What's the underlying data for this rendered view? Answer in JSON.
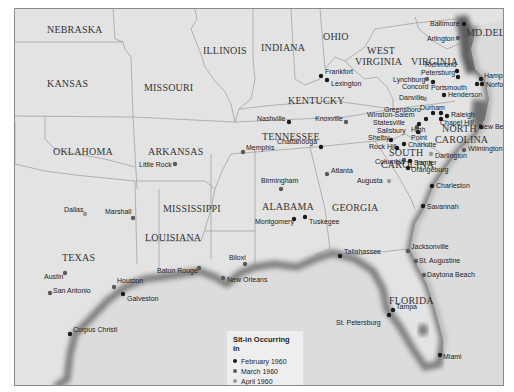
{
  "legend": {
    "title": "Sit-in Occurring in",
    "items": [
      {
        "label": "February 1960",
        "color": "#1a1a1a"
      },
      {
        "label": "March 1960",
        "color": "#5a5a5a"
      },
      {
        "label": "April 1960",
        "color": "#9a9a9a"
      }
    ]
  },
  "states": [
    {
      "name": "NEBRASKA",
      "x": 32,
      "y": 24
    },
    {
      "name": "KANSAS",
      "x": 32,
      "y": 78
    },
    {
      "name": "MISSOURI",
      "x": 129,
      "y": 82
    },
    {
      "name": "ILLINOIS",
      "x": 188,
      "y": 45
    },
    {
      "name": "INDIANA",
      "x": 246,
      "y": 42
    },
    {
      "name": "OHIO",
      "x": 308,
      "y": 31
    },
    {
      "name": "WEST",
      "x": 352,
      "y": 45
    },
    {
      "name": "VIRGINIA",
      "x": 340,
      "y": 56
    },
    {
      "name": "VIRGINIA",
      "x": 396,
      "y": 56
    },
    {
      "name": "MD.",
      "x": 451,
      "y": 27
    },
    {
      "name": "DEL.",
      "x": 470,
      "y": 27
    },
    {
      "name": "KENTUCKY",
      "x": 273,
      "y": 95
    },
    {
      "name": "TENNESSEE",
      "x": 247,
      "y": 131
    },
    {
      "name": "NORTH",
      "x": 427,
      "y": 123
    },
    {
      "name": "CAROLINA",
      "x": 420,
      "y": 134
    },
    {
      "name": "SOUTH",
      "x": 374,
      "y": 147
    },
    {
      "name": "CAROLINA",
      "x": 366,
      "y": 159
    },
    {
      "name": "OKLAHOMA",
      "x": 38,
      "y": 146
    },
    {
      "name": "ARKANSAS",
      "x": 133,
      "y": 146
    },
    {
      "name": "MISSISSIPPI",
      "x": 148,
      "y": 203
    },
    {
      "name": "ALABAMA",
      "x": 247,
      "y": 201
    },
    {
      "name": "GEORGIA",
      "x": 317,
      "y": 202
    },
    {
      "name": "LOUISIANA",
      "x": 130,
      "y": 232
    },
    {
      "name": "TEXAS",
      "x": 47,
      "y": 252
    },
    {
      "name": "FLORIDA",
      "x": 374,
      "y": 295
    }
  ],
  "cities": [
    {
      "name": "Baltimore",
      "x": 449,
      "y": 15,
      "month": "February 1960",
      "lx": 415,
      "ly": 17
    },
    {
      "name": "Arlington",
      "x": 443,
      "y": 29,
      "month": "March 1960",
      "lx": 412,
      "ly": 32
    },
    {
      "name": "Richmond",
      "x": 442,
      "y": 62,
      "month": "February 1960",
      "lx": 410,
      "ly": 58
    },
    {
      "name": "Petersburg",
      "x": 443,
      "y": 68,
      "month": "February 1960",
      "lx": 406,
      "ly": 66
    },
    {
      "name": "Hampton",
      "x": 466,
      "y": 70,
      "month": "February 1960",
      "lx": 469,
      "ly": 69
    },
    {
      "name": "Norfolk",
      "x": 467,
      "y": 75,
      "month": "February 1960",
      "lx": 471,
      "ly": 78
    },
    {
      "name": "Portsmouth",
      "x": 462,
      "y": 75,
      "month": "February 1960",
      "lx": 416,
      "ly": 81
    },
    {
      "name": "Lynchburg",
      "x": 412,
      "y": 70,
      "month": "March 1960",
      "lx": 378,
      "ly": 73
    },
    {
      "name": "Concord",
      "x": 418,
      "y": 73,
      "month": "February 1960",
      "lx": 387,
      "ly": 80
    },
    {
      "name": "Frankfort",
      "x": 306,
      "y": 67,
      "month": "February 1960",
      "lx": 310,
      "ly": 65
    },
    {
      "name": "Lexington",
      "x": 312,
      "y": 71,
      "month": "February 1960",
      "lx": 316,
      "ly": 77
    },
    {
      "name": "Danville",
      "x": 410,
      "y": 90,
      "month": "April 1960",
      "lx": 384,
      "ly": 91
    },
    {
      "name": "Henderson",
      "x": 429,
      "y": 86,
      "month": "February 1960",
      "lx": 433,
      "ly": 88
    },
    {
      "name": "Greensboro",
      "x": 418,
      "y": 104,
      "month": "February 1960",
      "lx": 369,
      "ly": 103
    },
    {
      "name": "Durham",
      "x": 426,
      "y": 104,
      "month": "February 1960",
      "lx": 405,
      "ly": 101
    },
    {
      "name": "Winston-Salem",
      "x": 411,
      "y": 110,
      "month": "February 1960",
      "lx": 352,
      "ly": 108
    },
    {
      "name": "Raleigh",
      "x": 432,
      "y": 107,
      "month": "February 1960",
      "lx": 436,
      "ly": 108
    },
    {
      "name": "Chapel Hill",
      "x": 426,
      "y": 110,
      "month": "February 1960",
      "lx": 425,
      "ly": 116
    },
    {
      "name": "Statesville",
      "x": 402,
      "y": 118,
      "month": "March 1960",
      "lx": 358,
      "ly": 116
    },
    {
      "name": "Salisbury",
      "x": 403,
      "y": 123,
      "month": "February 1960",
      "lx": 362,
      "ly": 124
    },
    {
      "name": "High",
      "x": 404,
      "y": 115,
      "month": "February 1960",
      "lx": 396,
      "ly": 123
    },
    {
      "name": "Point",
      "x": 0,
      "y": 0,
      "month": "",
      "lx": 396,
      "ly": 131
    },
    {
      "name": "Shelby",
      "x": 376,
      "y": 131,
      "month": "February 1960",
      "lx": 353,
      "ly": 131
    },
    {
      "name": "Rock Hill",
      "x": 382,
      "y": 139,
      "month": "February 1960",
      "lx": 354,
      "ly": 140
    },
    {
      "name": "Charlotte",
      "x": 389,
      "y": 135,
      "month": "February 1960",
      "lx": 393,
      "ly": 138
    },
    {
      "name": "New Bern",
      "x": 466,
      "y": 118,
      "month": "February 1960",
      "lx": 464,
      "ly": 120
    },
    {
      "name": "Wilmington",
      "x": 449,
      "y": 141,
      "month": "March 1960",
      "lx": 453,
      "ly": 142
    },
    {
      "name": "Darlington",
      "x": 416,
      "y": 145,
      "month": "April 1960",
      "lx": 420,
      "ly": 149
    },
    {
      "name": "Columbia",
      "x": 389,
      "y": 151,
      "month": "March 1960",
      "lx": 360,
      "ly": 155
    },
    {
      "name": "Sumter",
      "x": 395,
      "y": 152,
      "month": "February 1960",
      "lx": 399,
      "ly": 156
    },
    {
      "name": "Orangeburg",
      "x": 393,
      "y": 159,
      "month": "February 1960",
      "lx": 396,
      "ly": 163
    },
    {
      "name": "Augusta",
      "x": 374,
      "y": 172,
      "month": "April 1960",
      "lx": 342,
      "ly": 174
    },
    {
      "name": "Atlanta",
      "x": 312,
      "y": 165,
      "month": "March 1960",
      "lx": 316,
      "ly": 164
    },
    {
      "name": "Charleston",
      "x": 417,
      "y": 177,
      "month": "February 1960",
      "lx": 421,
      "ly": 179
    },
    {
      "name": "Savannah",
      "x": 408,
      "y": 197,
      "month": "February 1960",
      "lx": 412,
      "ly": 200
    },
    {
      "name": "Nashville",
      "x": 274,
      "y": 113,
      "month": "February 1960",
      "lx": 242,
      "ly": 112
    },
    {
      "name": "Knoxville",
      "x": 331,
      "y": 113,
      "month": "March 1960",
      "lx": 300,
      "ly": 112
    },
    {
      "name": "Chattanooga",
      "x": 306,
      "y": 138,
      "month": "February 1960",
      "lx": 262,
      "ly": 135
    },
    {
      "name": "Memphis",
      "x": 228,
      "y": 143,
      "month": "March 1960",
      "lx": 231,
      "ly": 141
    },
    {
      "name": "Little Rock",
      "x": 160,
      "y": 155,
      "month": "March 1960",
      "lx": 124,
      "ly": 158
    },
    {
      "name": "Birmingham",
      "x": 266,
      "y": 180,
      "month": "March 1960",
      "lx": 246,
      "ly": 174
    },
    {
      "name": "Montgomery",
      "x": 279,
      "y": 210,
      "month": "February 1960",
      "lx": 240,
      "ly": 215
    },
    {
      "name": "Tuskegee",
      "x": 290,
      "y": 208,
      "month": "February 1960",
      "lx": 294,
      "ly": 215
    },
    {
      "name": "Dallas",
      "x": 70,
      "y": 205,
      "month": "April 1960",
      "lx": 49,
      "ly": 203
    },
    {
      "name": "Marshall",
      "x": 118,
      "y": 209,
      "month": "March 1960",
      "lx": 90,
      "ly": 205
    },
    {
      "name": "Austin",
      "x": 50,
      "y": 264,
      "month": "March 1960",
      "lx": 29,
      "ly": 270
    },
    {
      "name": "San Antonio",
      "x": 35,
      "y": 284,
      "month": "March 1960",
      "lx": 38,
      "ly": 284
    },
    {
      "name": "Houston",
      "x": 99,
      "y": 278,
      "month": "March 1960",
      "lx": 102,
      "ly": 274
    },
    {
      "name": "Galveston",
      "x": 108,
      "y": 285,
      "month": "February 1960",
      "lx": 112,
      "ly": 292
    },
    {
      "name": "Corpus Christi",
      "x": 55,
      "y": 325,
      "month": "February 1960",
      "lx": 58,
      "ly": 323
    },
    {
      "name": "Baton Rouge",
      "x": 184,
      "y": 259,
      "month": "March 1960",
      "lx": 142,
      "ly": 264
    },
    {
      "name": "Biloxi",
      "x": 230,
      "y": 255,
      "month": "March 1960",
      "lx": 214,
      "ly": 251
    },
    {
      "name": "New Orleans",
      "x": 208,
      "y": 269,
      "month": "March 1960",
      "lx": 212,
      "ly": 273
    },
    {
      "name": "Tallahassee",
      "x": 325,
      "y": 247,
      "month": "February 1960",
      "lx": 329,
      "ly": 245
    },
    {
      "name": "Jacksonville",
      "x": 393,
      "y": 242,
      "month": "March 1960",
      "lx": 396,
      "ly": 240
    },
    {
      "name": "St. Augustine",
      "x": 401,
      "y": 252,
      "month": "March 1960",
      "lx": 404,
      "ly": 254
    },
    {
      "name": "Daytona Beach",
      "x": 409,
      "y": 266,
      "month": "March 1960",
      "lx": 412,
      "ly": 268
    },
    {
      "name": "Tampa",
      "x": 378,
      "y": 301,
      "month": "February 1960",
      "lx": 381,
      "ly": 300
    },
    {
      "name": "St. Petersburg",
      "x": 374,
      "y": 306,
      "month": "February 1960",
      "lx": 321,
      "ly": 316
    },
    {
      "name": "Miami",
      "x": 425,
      "y": 346,
      "month": "February 1960",
      "lx": 428,
      "ly": 350
    }
  ]
}
